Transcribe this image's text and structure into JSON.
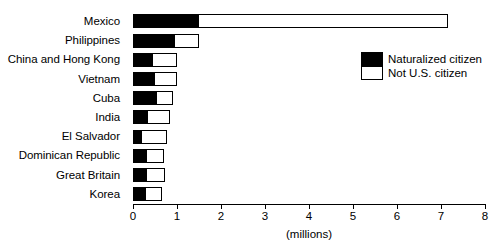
{
  "chart_data": {
    "type": "bar",
    "orientation": "horizontal",
    "stacked": true,
    "title": "",
    "subtitle": "",
    "xlabel": "(millions)",
    "ylabel": "",
    "xlim": [
      0,
      8
    ],
    "xticks": [
      "0",
      "1",
      "2",
      "3",
      "4",
      "5",
      "6",
      "7",
      "8"
    ],
    "grid": false,
    "legend_position": "upper right",
    "categories": [
      "Mexico",
      "Philippines",
      "China and Hong Kong",
      "Vietnam",
      "Cuba",
      "India",
      "El Salvador",
      "Dominican Republic",
      "Great Britain",
      "Korea"
    ],
    "series": [
      {
        "name": "Naturalized citizen",
        "color": "#000000",
        "values": [
          1.5,
          0.95,
          0.45,
          0.5,
          0.55,
          0.35,
          0.2,
          0.32,
          0.32,
          0.3
        ]
      },
      {
        "name": "Not U.S. citizen",
        "color": "#ffffff",
        "values": [
          5.65,
          0.55,
          0.55,
          0.5,
          0.35,
          0.5,
          0.58,
          0.38,
          0.4,
          0.35
        ]
      }
    ],
    "totals": [
      7.15,
      1.5,
      1.0,
      1.0,
      0.9,
      0.85,
      0.78,
      0.7,
      0.72,
      0.65
    ]
  },
  "axis": {
    "x_title": "(millions)"
  },
  "legend": {
    "items": [
      {
        "label": "Naturalized citizen",
        "swatch": "filled"
      },
      {
        "label": "Not U.S. citizen",
        "swatch": "empty"
      }
    ]
  }
}
